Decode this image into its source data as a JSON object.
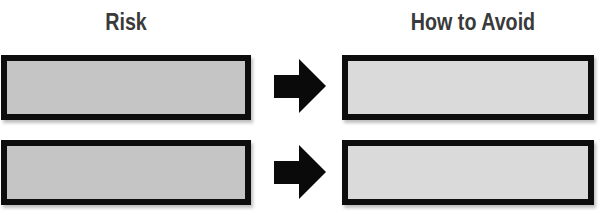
{
  "diagram": {
    "type": "risk-mitigation-table",
    "columns": [
      {
        "label": "Risk"
      },
      {
        "label": "How to Avoid"
      }
    ],
    "rows": [
      {
        "risk": "",
        "how_to_avoid": "",
        "connector": "arrow-right-icon"
      },
      {
        "risk": "",
        "how_to_avoid": "",
        "connector": "arrow-right-icon"
      }
    ],
    "colors": {
      "border": "#0d0d0d",
      "risk_fill": "#c5c5c5",
      "avoid_fill": "#dadada",
      "arrow": "#0a0a0a",
      "header_text": "#3a3a3a"
    }
  }
}
